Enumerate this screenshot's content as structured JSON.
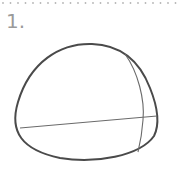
{
  "step": {
    "label": "1."
  },
  "colors": {
    "outline": "#4a4a4a",
    "guide": "#6a6a6a",
    "label": "#9a9a9a",
    "dots": "#b5b5b5"
  },
  "drawing": {
    "shape": "rounded egg/head outline with horizontal and vertical guide lines"
  }
}
